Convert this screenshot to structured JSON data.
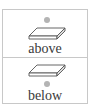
{
  "options": [
    {
      "label": "above",
      "icon": "slab-with-dot-above-icon"
    },
    {
      "label": "below",
      "icon": "slab-with-dot-below-icon"
    }
  ],
  "colors": {
    "border": "#c8c8c8",
    "dot": "#b4b4b4",
    "text": "#3a3a3a"
  }
}
